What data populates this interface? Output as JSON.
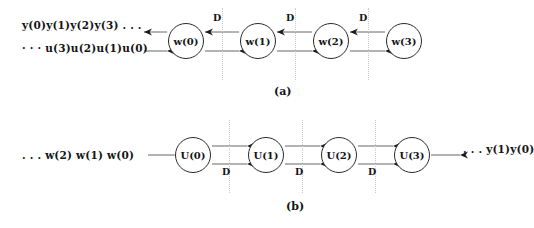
{
  "figure": {
    "width": 532,
    "height": 228,
    "background": "#ffffff",
    "line_color": "#2b2b2b",
    "dash_color": "#c9c9c9",
    "text_color": "#141414"
  },
  "panels": [
    {
      "id": "a",
      "caption": "(a)",
      "caption_x": 274,
      "caption_y": 86,
      "row_center_y": 41,
      "nodes": [
        {
          "label": "w(0)",
          "cx": 186,
          "cy": 41,
          "r": 18
        },
        {
          "label": "w(1)",
          "cx": 258,
          "cy": 41,
          "r": 18
        },
        {
          "label": "w(2)",
          "cx": 331,
          "cy": 41,
          "r": 18
        },
        {
          "label": "w(3)",
          "cx": 404,
          "cy": 41,
          "r": 18
        }
      ],
      "separators": [
        {
          "label": "D",
          "x": 222,
          "y_top": 8,
          "y_bottom": 80,
          "label_x": 213,
          "label_y": 13
        },
        {
          "label": "D",
          "x": 295,
          "y_top": 8,
          "y_bottom": 80,
          "label_x": 286,
          "label_y": 13
        },
        {
          "label": "D",
          "x": 368,
          "y_top": 8,
          "y_bottom": 80,
          "label_x": 359,
          "label_y": 13
        }
      ],
      "streams": [
        {
          "text": "y(0)y(1)y(2)y(3) . . .",
          "x": 22,
          "y": 20,
          "direction": "left"
        },
        {
          "text": "· · · u(3)u(2)u(1)u(0)",
          "x": 22,
          "y": 43,
          "direction": "right"
        }
      ],
      "top_line_y": 32,
      "bottom_line_y": 51,
      "top_direction": "left",
      "bottom_direction": "right",
      "external_left_x": 144
    },
    {
      "id": "b",
      "caption": "(b)",
      "caption_x": 286,
      "caption_y": 201,
      "row_center_y": 155,
      "nodes": [
        {
          "label": "U(0)",
          "cx": 193,
          "cy": 155,
          "r": 18
        },
        {
          "label": "U(1)",
          "cx": 266,
          "cy": 155,
          "r": 18
        },
        {
          "label": "U(2)",
          "cx": 339,
          "cy": 155,
          "r": 18
        },
        {
          "label": "U(3)",
          "cx": 412,
          "cy": 155,
          "r": 18
        }
      ],
      "separators": [
        {
          "label": "D",
          "x": 229,
          "y_top": 120,
          "y_bottom": 193,
          "label_x": 222,
          "label_y": 167
        },
        {
          "label": "D",
          "x": 302,
          "y_top": 120,
          "y_bottom": 193,
          "label_x": 295,
          "label_y": 167
        },
        {
          "label": "D",
          "x": 375,
          "y_top": 120,
          "y_bottom": 193,
          "label_x": 368,
          "label_y": 167
        }
      ],
      "streams": [
        {
          "text": ". . . w(2) w(1) w(0)",
          "x": 22,
          "y": 150,
          "direction": "right"
        },
        {
          "text": ". . . y(1)y(0)",
          "x": 463,
          "y": 144,
          "direction": "right"
        }
      ],
      "top_line_y": 146,
      "bottom_line_y": 164,
      "top_direction": "right",
      "bottom_direction": "right",
      "external_left_x": 148,
      "external_right_x": 460
    }
  ]
}
